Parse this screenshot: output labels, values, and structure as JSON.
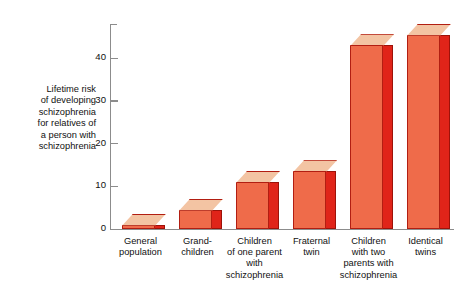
{
  "chart_data": {
    "type": "bar",
    "title": "",
    "subtitle": "",
    "xlabel": "",
    "ylabel": "Lifetime risk\nof developing\nschizophrenia\nfor relatives of\na person with\nschizophrenia",
    "categories": [
      "General\npopulation",
      "Grand-\nchildren",
      "Children\nof one parent\nwith\nschizophrenia",
      "Fraternal\ntwin",
      "Children\nwith two\nparents with\nschizophrenia",
      "Identical\ntwins"
    ],
    "values": [
      1,
      4.5,
      11,
      13.5,
      43,
      45.5
    ],
    "ylim": [
      0,
      48
    ],
    "yticks": [
      0,
      10,
      20,
      30,
      40
    ],
    "ytick_labels": [
      "0",
      "10",
      "20",
      "30",
      "40"
    ],
    "grid": false,
    "legend": false,
    "legend_position": "none",
    "bar_style": "3d-extruded",
    "colors": {
      "bar_front": "#ef6b4a",
      "bar_side": "#e02419",
      "bar_top": "#f3c4a3",
      "bar_outline": "#b21e12",
      "axis": "#8c8c8c",
      "text": "#111111",
      "background": "#ffffff"
    }
  }
}
